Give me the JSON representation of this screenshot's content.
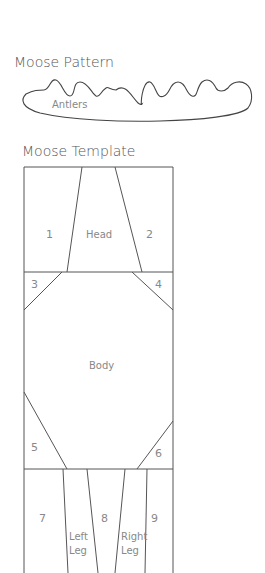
{
  "pattern": {
    "title": "Moose Pattern",
    "antlers_label": "Antlers"
  },
  "template": {
    "title": "Moose Template",
    "pieces": {
      "p1": "1",
      "p2": "2",
      "p3": "3",
      "p4": "4",
      "p5": "5",
      "p6": "6",
      "p7": "7",
      "p8": "8",
      "p9": "9",
      "head": "Head",
      "body": "Body",
      "left_leg_line1": "Left",
      "left_leg_line2": "Leg",
      "right_leg_line1": "Right",
      "right_leg_line2": "Leg"
    }
  },
  "colors": {
    "line": "#555555",
    "text": "#888888",
    "background": "#ffffff"
  }
}
